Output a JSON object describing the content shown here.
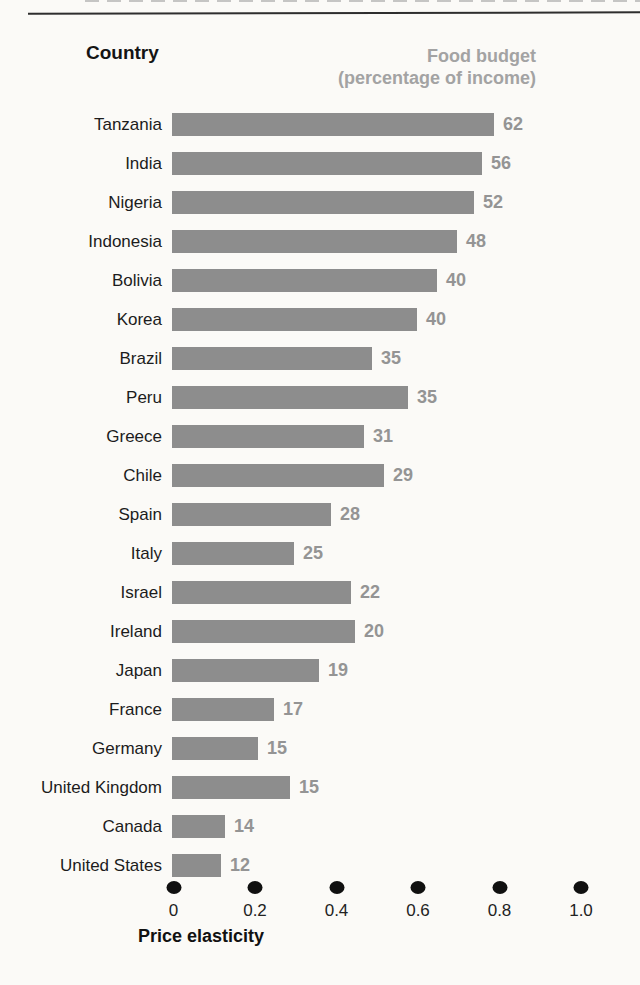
{
  "header": {
    "left_label": "Country",
    "right_label_line1": "Food budget",
    "right_label_line2": "(percentage of income)"
  },
  "chart_data": {
    "type": "bar",
    "orientation": "horizontal",
    "title": "",
    "xlabel": "Price elasticity",
    "ylabel": "Country",
    "xlim": [
      0,
      1.0
    ],
    "grid": false,
    "legend_position": "none",
    "x_ticks": [
      "0",
      "0.2",
      "0.4",
      "0.6",
      "0.8",
      "1.0"
    ],
    "x_tick_values": [
      0,
      0.2,
      0.4,
      0.6,
      0.8,
      1.0
    ],
    "categories": [
      "Tanzania",
      "India",
      "Nigeria",
      "Indonesia",
      "Bolivia",
      "Korea",
      "Brazil",
      "Peru",
      "Greece",
      "Chile",
      "Spain",
      "Italy",
      "Israel",
      "Ireland",
      "Japan",
      "France",
      "Germany",
      "United Kingdom",
      "Canada",
      "United States"
    ],
    "series": [
      {
        "name": "Price elasticity (bar length, estimated from axis)",
        "values": [
          0.79,
          0.76,
          0.74,
          0.7,
          0.65,
          0.6,
          0.49,
          0.58,
          0.47,
          0.52,
          0.39,
          0.3,
          0.44,
          0.45,
          0.36,
          0.25,
          0.21,
          0.29,
          0.13,
          0.12
        ]
      },
      {
        "name": "Food budget (percentage of income) — printed labels",
        "values": [
          62,
          56,
          52,
          48,
          40,
          40,
          35,
          35,
          31,
          29,
          28,
          25,
          22,
          20,
          19,
          17,
          15,
          15,
          14,
          12
        ]
      }
    ],
    "colors": {
      "bar": "#8d8d8d",
      "value_label": "#949494",
      "country_label": "#1c1c1c",
      "header_gray": "#a3a3a3",
      "axis_dot": "#101010",
      "background": "#fbfaf7",
      "rule": "#2e2e2e"
    }
  }
}
